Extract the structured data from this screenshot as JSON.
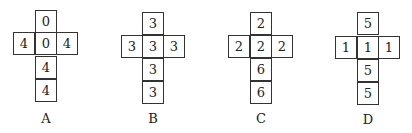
{
  "figure": {
    "nets": [
      {
        "label": "A",
        "top": "0",
        "left": "4",
        "center": "0",
        "right": "4",
        "below1": "4",
        "below2": "4"
      },
      {
        "label": "B",
        "top": "3",
        "left": "3",
        "center": "3",
        "right": "3",
        "below1": "3",
        "below2": "3"
      },
      {
        "label": "C",
        "top": "2",
        "left": "2",
        "center": "2",
        "right": "2",
        "below1": "6",
        "below2": "6"
      },
      {
        "label": "D",
        "top": "5",
        "left": "1",
        "center": "1",
        "right": "1",
        "below1": "5",
        "below2": "5"
      }
    ],
    "colors": {
      "line": "#333333",
      "text": "#222222",
      "background": "#ffffff"
    }
  }
}
